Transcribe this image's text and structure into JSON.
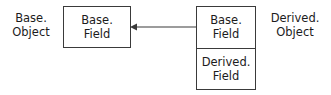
{
  "diagram": {
    "title": "",
    "background_color": "#ffffff",
    "line_color": "#3a3a3a",
    "text_color": "#1c1c1c",
    "labels": [
      {
        "name": "base-object",
        "text": "Base.\nObject"
      },
      {
        "name": "derived-object",
        "text": "Derived.\nObject"
      }
    ],
    "boxes": [
      {
        "name": "base-field-box",
        "cells": [
          {
            "name": "base-field-cell",
            "text": "Base.\nField"
          }
        ]
      },
      {
        "name": "derived-object-box",
        "cells": [
          {
            "name": "base-field-cell",
            "text": "Base.\nField"
          },
          {
            "name": "derived-field-cell",
            "text": "Derived.\nField"
          }
        ]
      }
    ],
    "connector": {
      "name": "association-arrow",
      "direction": "left",
      "style": "solid",
      "arrowhead": "solid-triangle",
      "from": "derived-object-box",
      "to": "base-field-box"
    }
  }
}
